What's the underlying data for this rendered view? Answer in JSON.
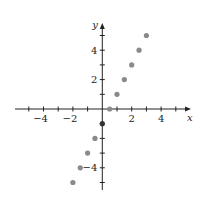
{
  "chart_data": {
    "type": "scatter",
    "title": "",
    "xlabel": "x",
    "ylabel": "y",
    "xlim": [
      -5.5,
      5.5
    ],
    "ylim": [
      -5.5,
      5.5
    ],
    "grid": false,
    "legend": null,
    "x_ticks": [
      -5,
      -4,
      -3,
      -2,
      -1,
      1,
      2,
      3,
      4,
      5
    ],
    "y_ticks": [
      -5,
      -4,
      -3,
      -2,
      -1,
      1,
      2,
      3,
      4,
      5
    ],
    "x_tick_labels": [
      "-4",
      "-2",
      "2",
      "4"
    ],
    "y_tick_labels": [
      "4",
      "2",
      "-4"
    ],
    "series": [
      {
        "name": "points",
        "color": "#8a8a8a",
        "points": [
          {
            "x": -2,
            "y": -5
          },
          {
            "x": -1.5,
            "y": -4
          },
          {
            "x": -1,
            "y": -3
          },
          {
            "x": -0.5,
            "y": -2
          },
          {
            "x": 0,
            "y": -1
          },
          {
            "x": 0.5,
            "y": 0
          },
          {
            "x": 1,
            "y": 1
          },
          {
            "x": 1.5,
            "y": 2
          },
          {
            "x": 2,
            "y": 3
          },
          {
            "x": 2.5,
            "y": 4
          },
          {
            "x": 3,
            "y": 5
          }
        ]
      }
    ]
  }
}
